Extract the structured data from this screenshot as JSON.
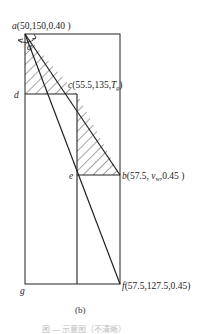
{
  "diagram": {
    "points": {
      "a": {
        "name": "a",
        "coords": "(50,150,0.40 )"
      },
      "c": {
        "name": "c",
        "coords": "(55.5,135,",
        "tail_symbol": "T",
        "tail_sub": "g",
        "close": ")"
      },
      "d": {
        "name": "d"
      },
      "e": {
        "name": "e"
      },
      "b": {
        "name": "b",
        "coords_pre": "(57.5, ",
        "v_symbol": "v",
        "v_sub": "w",
        "coords_post": ",0.45 )"
      },
      "f": {
        "name": "f",
        "coords": "(57.5,127.5,0.45)"
      },
      "g": {
        "name": "g"
      }
    },
    "angle_label": "α",
    "subfigure_label": "(b)",
    "caption": "图 — 示意图（不清晰）"
  }
}
